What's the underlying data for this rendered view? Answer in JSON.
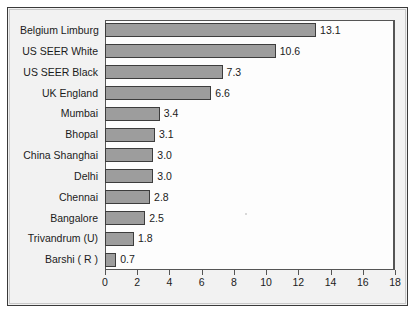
{
  "chart_data": {
    "type": "bar",
    "orientation": "horizontal",
    "title": "",
    "subtitle": "",
    "xlabel": "",
    "ylabel": "",
    "categories": [
      "Belgium Limburg",
      "US SEER White",
      "US SEER Black",
      "UK England",
      "Mumbai",
      "Bhopal",
      "China Shanghai",
      "Delhi",
      "Chennai",
      "Bangalore",
      "Trivandrum (U)",
      "Barshi ( R )"
    ],
    "values": [
      13.1,
      10.6,
      7.3,
      6.6,
      3.4,
      3.1,
      3.0,
      3.0,
      2.8,
      2.5,
      1.8,
      0.7
    ],
    "value_labels": [
      "13.1",
      "10.6",
      "7.3",
      "6.6",
      "3.4",
      "3.1",
      "3.0",
      "3.0",
      "2.8",
      "2.5",
      "1.8",
      "0.7"
    ],
    "xlim": [
      0,
      18
    ],
    "xticks": [
      0,
      2,
      4,
      6,
      8,
      10,
      12,
      14,
      16,
      18
    ],
    "xtick_labels": [
      "0",
      "2",
      "4",
      "6",
      "8",
      "10",
      "12",
      "14",
      "16",
      "18"
    ],
    "grid": false,
    "legend": null,
    "legend_position": "none",
    "bar_color": "#9d9d9d",
    "bar_border_color": "#3d3d3d",
    "plot_background": "#fdfdfd",
    "panel_background": "#f1f1f1",
    "panel_border_color": "#3a3a3a",
    "axis_color": "#555555",
    "text_color": "#1b1b1b",
    "data_labels_shown": true
  }
}
